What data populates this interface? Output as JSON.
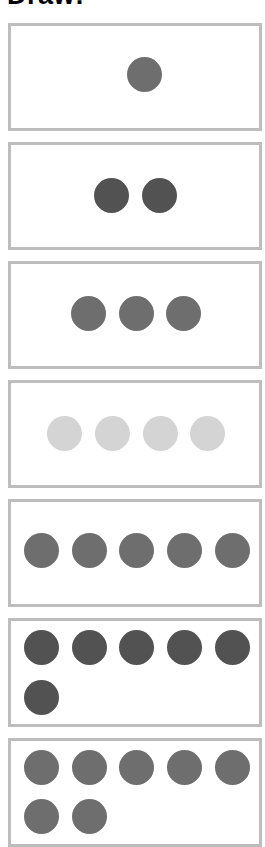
{
  "title": "Draw:",
  "colors": {
    "border": "#bdbdbd",
    "medium_gray": "#6e6e6e",
    "dark_gray": "#525252",
    "light_gray": "#d4d4d4"
  },
  "boxes": [
    {
      "count": 1,
      "color": "#6e6e6e",
      "top": 23,
      "height": 102,
      "dots": [
        [
          127,
          57
        ]
      ]
    },
    {
      "count": 2,
      "color": "#525252",
      "top": 142,
      "height": 102,
      "dots": [
        [
          94,
          178
        ],
        [
          142,
          178
        ]
      ]
    },
    {
      "count": 3,
      "color": "#6e6e6e",
      "top": 261,
      "height": 102,
      "dots": [
        [
          71,
          296
        ],
        [
          119,
          296
        ],
        [
          166,
          296
        ]
      ]
    },
    {
      "count": 4,
      "color": "#d4d4d4",
      "top": 380,
      "height": 102,
      "dots": [
        [
          47,
          416
        ],
        [
          95,
          416
        ],
        [
          143,
          416
        ],
        [
          190,
          416
        ]
      ]
    },
    {
      "count": 5,
      "color": "#6e6e6e",
      "top": 499,
      "height": 102,
      "dots": [
        [
          24,
          533
        ],
        [
          72,
          533
        ],
        [
          119,
          533
        ],
        [
          167,
          533
        ],
        [
          215,
          533
        ]
      ]
    },
    {
      "count": 6,
      "color": "#525252",
      "top": 618,
      "height": 103,
      "dots": [
        [
          24,
          630
        ],
        [
          72,
          630
        ],
        [
          119,
          630
        ],
        [
          167,
          630
        ],
        [
          215,
          630
        ],
        [
          24,
          680
        ]
      ]
    },
    {
      "count": 7,
      "color": "#6e6e6e",
      "top": 738,
      "height": 103,
      "dots": [
        [
          24,
          750
        ],
        [
          72,
          750
        ],
        [
          119,
          750
        ],
        [
          167,
          750
        ],
        [
          215,
          750
        ],
        [
          24,
          799
        ],
        [
          72,
          799
        ]
      ]
    }
  ]
}
